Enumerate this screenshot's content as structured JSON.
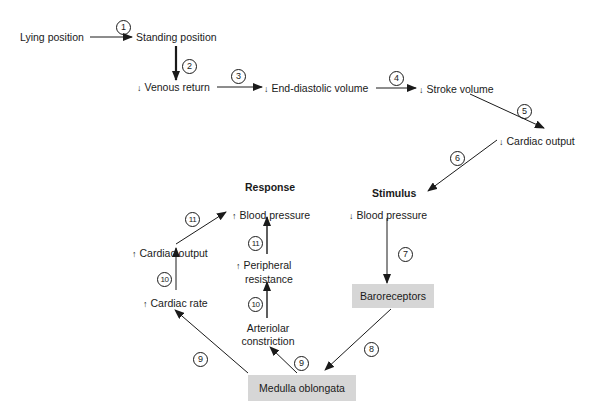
{
  "diagram": {
    "nodes": {
      "lying": "Lying position",
      "standing": "Standing position",
      "venous": {
        "dir": "↓",
        "label": "Venous return"
      },
      "edv": {
        "dir": "↓",
        "label": "End-diastolic volume"
      },
      "stroke": {
        "dir": "↓",
        "label": "Stroke volume"
      },
      "cardiac_out_down": {
        "dir": "↓",
        "label": "Cardiac output"
      },
      "bp_down": {
        "dir": "↓",
        "label": "Blood pressure"
      },
      "baroreceptors": "Baroreceptors",
      "medulla": "Medulla oblongata",
      "cardiac_rate": {
        "dir": "↑",
        "label": "Cardiac rate"
      },
      "cardiac_out_up": {
        "dir": "↑",
        "label": "Cardiac output"
      },
      "arteriolar_1": "Arteriolar",
      "arteriolar_2": "constriction",
      "peripheral_1": "Peripheral",
      "peripheral_2": "resistance",
      "bp_up": {
        "dir": "↑",
        "label": "Blood pressure"
      }
    },
    "headers": {
      "response": "Response",
      "stimulus": "Stimulus"
    },
    "steps": [
      "1",
      "2",
      "3",
      "4",
      "5",
      "6",
      "7",
      "8",
      "9",
      "9",
      "10",
      "10",
      "11",
      "11"
    ],
    "colors": {
      "box_fill": "#d6d6d6",
      "line": "#1a1a1a"
    }
  }
}
